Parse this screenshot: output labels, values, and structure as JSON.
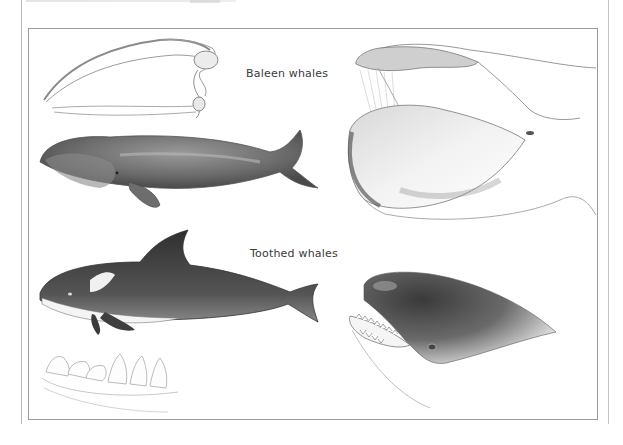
{
  "plate": {
    "labels": {
      "baleen": "Baleen whales",
      "toothed": "Toothed whales"
    },
    "illustrations": [
      {
        "id": "baleen-skull",
        "group": "baleen"
      },
      {
        "id": "right-whale-body",
        "group": "baleen"
      },
      {
        "id": "right-whale-head-open-mouth",
        "group": "baleen"
      },
      {
        "id": "orca-body",
        "group": "toothed"
      },
      {
        "id": "orca-head-teeth",
        "group": "toothed"
      },
      {
        "id": "toothed-jaw-teeth",
        "group": "toothed"
      }
    ],
    "colors": {
      "frame": "#9a9a9a",
      "ink_dark": "#2e2e2e",
      "ink_mid": "#777777",
      "ink_light": "#bdbdbd",
      "paper": "#ffffff"
    }
  }
}
